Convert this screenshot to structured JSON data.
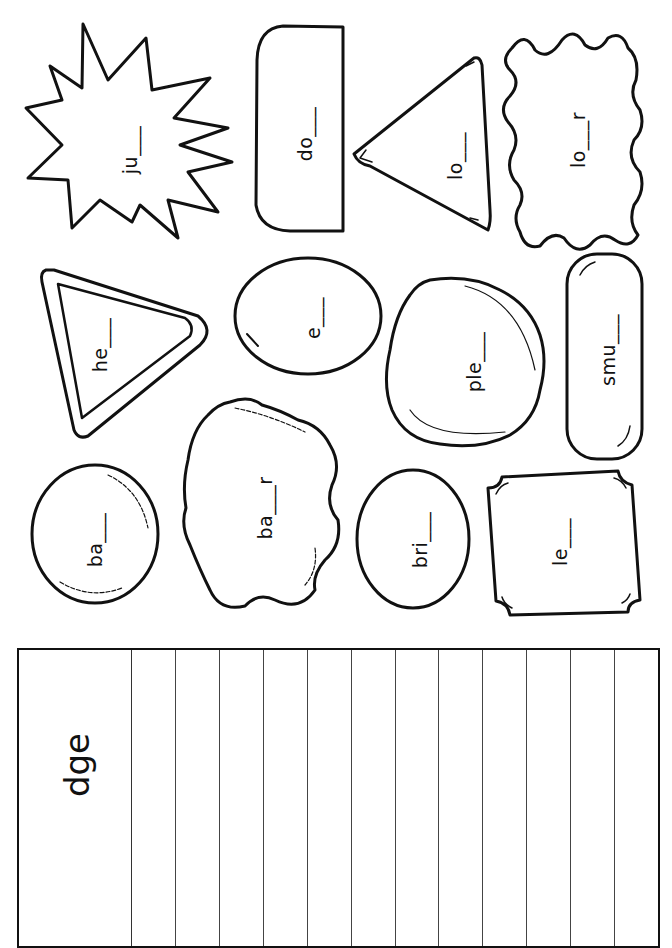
{
  "worksheet": {
    "ending": "dge",
    "shapes": [
      {
        "id": "starburst",
        "shape": "starburst",
        "word": "ju___"
      },
      {
        "id": "d-shape",
        "shape": "half-rounded-rectangle",
        "word": "do___"
      },
      {
        "id": "triangle",
        "shape": "triangle",
        "word": "lo___"
      },
      {
        "id": "wavy-blob-top",
        "shape": "wavy-blob",
        "word": "lo___r"
      },
      {
        "id": "rounded-triangle",
        "shape": "rounded-triangle-frame",
        "word": "he___"
      },
      {
        "id": "ellipse-small",
        "shape": "ellipse",
        "word": "e___"
      },
      {
        "id": "blob",
        "shape": "irregular-blob",
        "word": "ple___"
      },
      {
        "id": "pill",
        "shape": "pill",
        "word": "smu___"
      },
      {
        "id": "oval-left",
        "shape": "oval",
        "word": "ba___"
      },
      {
        "id": "wavy-blob-bottom",
        "shape": "wavy-blob",
        "word": "ba___r"
      },
      {
        "id": "oval-mid",
        "shape": "oval",
        "word": "bri___"
      },
      {
        "id": "scalloped-rect",
        "shape": "scalloped-rectangle",
        "word": "le___"
      }
    ],
    "answer_table": {
      "header": "dge",
      "blank_columns": 12
    }
  },
  "colors": {
    "ink": "#111111",
    "paper": "#ffffff"
  }
}
